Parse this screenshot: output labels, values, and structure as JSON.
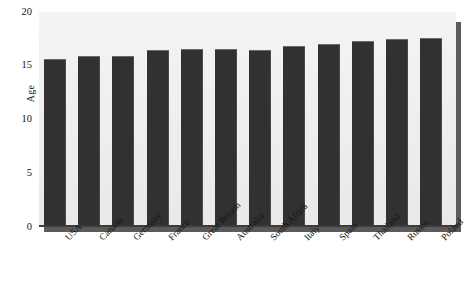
{
  "chart_data": {
    "type": "bar",
    "title": "",
    "xlabel": "",
    "ylabel": "Age",
    "ylim": [
      0,
      20
    ],
    "yticks": [
      0,
      5,
      10,
      15,
      20
    ],
    "ytick_labels": [
      "0",
      "5",
      "10",
      "15",
      "20"
    ],
    "grid": false,
    "legend": false,
    "orientation": "vertical",
    "bar_color": "#313131",
    "plot_background": "#eeeeec",
    "categories": [
      "USA",
      "Canada",
      "Germany",
      "France",
      "Great Britain",
      "Australia",
      "South Africa",
      "Italy",
      "Spain",
      "Thailand",
      "Russia",
      "Poland"
    ],
    "values": [
      15.6,
      15.9,
      15.9,
      16.5,
      16.6,
      16.6,
      16.5,
      16.8,
      17.0,
      17.3,
      17.5,
      17.6
    ]
  }
}
